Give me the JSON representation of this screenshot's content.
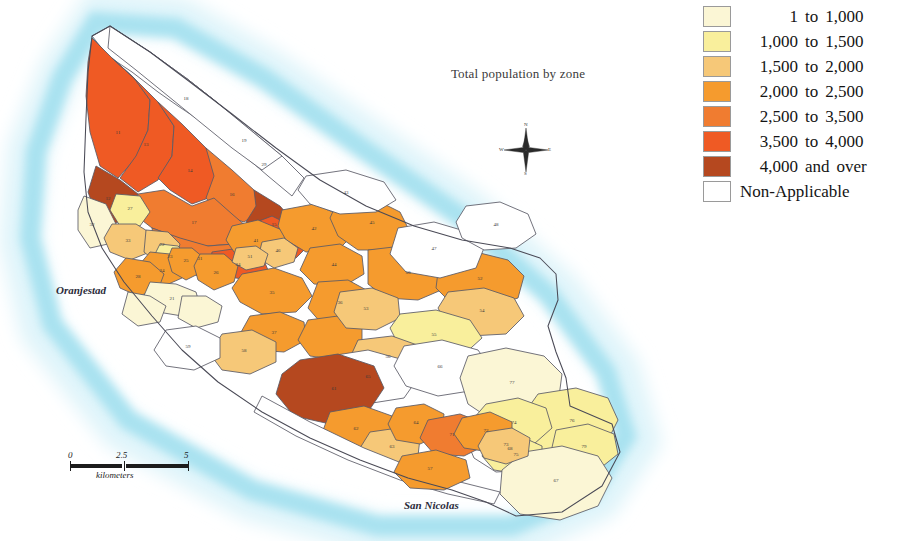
{
  "map": {
    "title": "Total population by zone",
    "region_name": "Aruba",
    "place_labels": [
      {
        "name": "Oranjestad",
        "text": "Oranjestad"
      },
      {
        "name": "San Nicolas",
        "text": "San Nicolas"
      }
    ],
    "compass": {
      "north": "N",
      "south": "S",
      "east": "E",
      "west": "W"
    },
    "scale": {
      "min": "0",
      "mid": "2.5",
      "max": "5",
      "units": "kilometers"
    },
    "colors": {
      "water": "#b8e7f2",
      "water_outer": "#d9f2f8",
      "land_na": "#ffffff",
      "border": "#5a5a66",
      "background": "#ffffff"
    }
  },
  "legend": {
    "title": "",
    "entries": [
      {
        "lo": "1",
        "mid": "to",
        "hi": "1,000",
        "color": "#fbf6d5"
      },
      {
        "lo": "1,000",
        "mid": "to",
        "hi": "1,500",
        "color": "#f9ef9c"
      },
      {
        "lo": "1,500",
        "mid": "to",
        "hi": "2,000",
        "color": "#f6c878"
      },
      {
        "lo": "2,000",
        "mid": "to",
        "hi": "2,500",
        "color": "#f59b2e"
      },
      {
        "lo": "2,500",
        "mid": "to",
        "hi": "3,500",
        "color": "#f07c30"
      },
      {
        "lo": "3,500",
        "mid": "to",
        "hi": "4,000",
        "color": "#ef5a24"
      },
      {
        "lo": "4,000",
        "mid": "and",
        "hi": "over",
        "color": "#b5481f"
      },
      {
        "single": "Non-Applicable",
        "color": "#ffffff"
      }
    ]
  },
  "chart_data": {
    "type": "choropleth-map",
    "title": "Total population by zone",
    "value_label": "Total population",
    "unit": "persons",
    "classes": [
      {
        "label": "1 to 1,000",
        "min": 1,
        "max": 1000,
        "color": "#fbf6d5"
      },
      {
        "label": "1,000 to 1,500",
        "min": 1000,
        "max": 1500,
        "color": "#f9ef9c"
      },
      {
        "label": "1,500 to 2,000",
        "min": 1500,
        "max": 2000,
        "color": "#f6c878"
      },
      {
        "label": "2,000 to 2,500",
        "min": 2000,
        "max": 2500,
        "color": "#f59b2e"
      },
      {
        "label": "2,500 to 3,500",
        "min": 2500,
        "max": 3500,
        "color": "#f07c30"
      },
      {
        "label": "3,500 to 4,000",
        "min": 3500,
        "max": 4000,
        "color": "#ef5a24"
      },
      {
        "label": "4,000 and over",
        "min": 4000,
        "max": null,
        "color": "#b5481f"
      },
      {
        "label": "Non-Applicable",
        "min": null,
        "max": null,
        "color": "#ffffff"
      }
    ],
    "zones": [
      {
        "id": "11",
        "class": 6
      },
      {
        "id": "12",
        "class": 7
      },
      {
        "id": "13",
        "class": 6
      },
      {
        "id": "14",
        "class": 6
      },
      {
        "id": "15",
        "class": 7
      },
      {
        "id": "16",
        "class": 5
      },
      {
        "id": "17",
        "class": 5
      },
      {
        "id": "18",
        "class": 8
      },
      {
        "id": "19",
        "class": 8
      },
      {
        "id": "21",
        "class": 1
      },
      {
        "id": "22",
        "class": 3
      },
      {
        "id": "23",
        "class": 2
      },
      {
        "id": "24",
        "class": 4
      },
      {
        "id": "25",
        "class": 4
      },
      {
        "id": "26",
        "class": 4
      },
      {
        "id": "27",
        "class": 2
      },
      {
        "id": "28",
        "class": 4
      },
      {
        "id": "29",
        "class": 8
      },
      {
        "id": "31",
        "class": 5
      },
      {
        "id": "32",
        "class": 1
      },
      {
        "id": "33",
        "class": 3
      },
      {
        "id": "34",
        "class": 6
      },
      {
        "id": "35",
        "class": 4
      },
      {
        "id": "36",
        "class": 4
      },
      {
        "id": "41",
        "class": 4
      },
      {
        "id": "42",
        "class": 4
      },
      {
        "id": "43",
        "class": 8
      },
      {
        "id": "44",
        "class": 4
      },
      {
        "id": "45",
        "class": 4
      },
      {
        "id": "46",
        "class": 3
      },
      {
        "id": "47",
        "class": 8
      },
      {
        "id": "48",
        "class": 8
      },
      {
        "id": "50",
        "class": 4
      },
      {
        "id": "51",
        "class": 3
      },
      {
        "id": "52",
        "class": 4
      },
      {
        "id": "53",
        "class": 3
      },
      {
        "id": "54",
        "class": 3
      },
      {
        "id": "55",
        "class": 2
      },
      {
        "id": "56",
        "class": 3
      },
      {
        "id": "57",
        "class": 4
      },
      {
        "id": "58",
        "class": 3
      },
      {
        "id": "59",
        "class": 8
      },
      {
        "id": "61",
        "class": 7
      },
      {
        "id": "62",
        "class": 4
      },
      {
        "id": "63",
        "class": 3
      },
      {
        "id": "64",
        "class": 4
      },
      {
        "id": "65",
        "class": 8
      },
      {
        "id": "66",
        "class": 8
      },
      {
        "id": "67",
        "class": 1
      },
      {
        "id": "68",
        "class": 8
      },
      {
        "id": "71",
        "class": 5
      },
      {
        "id": "72",
        "class": 4
      },
      {
        "id": "73",
        "class": 3
      },
      {
        "id": "74",
        "class": 2
      },
      {
        "id": "75",
        "class": 2
      },
      {
        "id": "76",
        "class": 2
      },
      {
        "id": "77",
        "class": 1
      },
      {
        "id": "79",
        "class": 2
      }
    ]
  }
}
